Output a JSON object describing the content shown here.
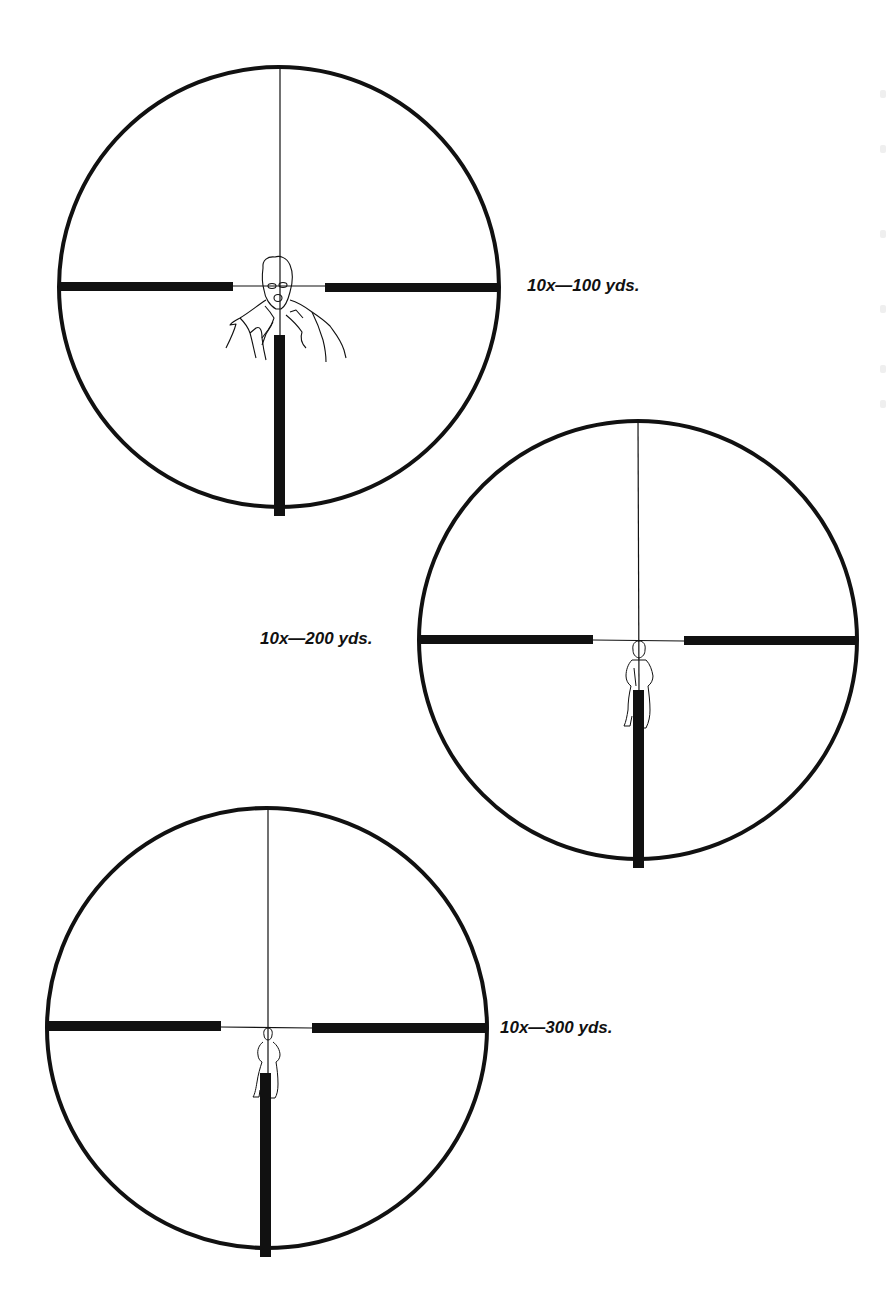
{
  "figure": {
    "colors": {
      "ink": "#111111",
      "background": "#ffffff"
    },
    "scopes": [
      {
        "id": "scope-100",
        "label": "10x—100 yds.",
        "magnification": "10x",
        "range": "100 yds.",
        "center": [
          279,
          287
        ],
        "radius": 221,
        "label_pos": [
          527,
          277
        ],
        "bar_left_end": 233,
        "bar_right_start": 325,
        "bar_bottom_start": 335,
        "target": "masked-figure-closeup"
      },
      {
        "id": "scope-200",
        "label": "10x—200 yds.",
        "magnification": "10x",
        "range": "200 yds.",
        "center": [
          638,
          640
        ],
        "radius": 220,
        "label_pos": [
          260,
          630
        ],
        "bar_left_end": 593,
        "bar_right_start": 684,
        "bar_bottom_start": 690,
        "target": "standing-figure-medium"
      },
      {
        "id": "scope-300",
        "label": "10x—300 yds.",
        "magnification": "10x",
        "range": "300 yds.",
        "center": [
          267,
          1028
        ],
        "radius": 221,
        "label_pos": [
          500,
          1019
        ],
        "bar_left_end": 221,
        "bar_right_start": 312,
        "bar_bottom_start": 1073,
        "target": "standing-figure-small"
      }
    ]
  }
}
